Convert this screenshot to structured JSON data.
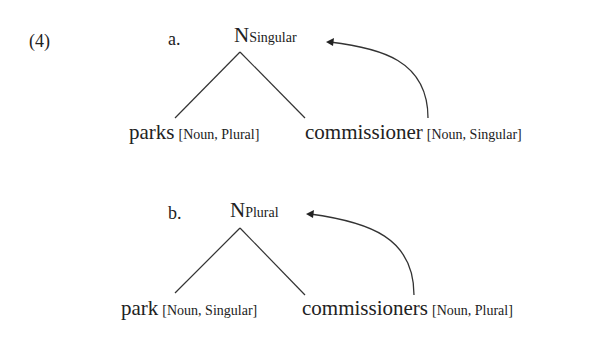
{
  "example_number": "(4)",
  "trees": [
    {
      "label": "a.",
      "root": {
        "head": "N",
        "feature": "Singular"
      },
      "left": {
        "word": "parks",
        "features": "[Noun, Plural]"
      },
      "right": {
        "word": "commissioner",
        "features": "[Noun, Singular]"
      }
    },
    {
      "label": "b.",
      "root": {
        "head": "N",
        "feature": "Plural"
      },
      "left": {
        "word": "park",
        "features": "[Noun, Singular]"
      },
      "right": {
        "word": "commissioners",
        "features": "[Noun, Plural]"
      }
    }
  ]
}
